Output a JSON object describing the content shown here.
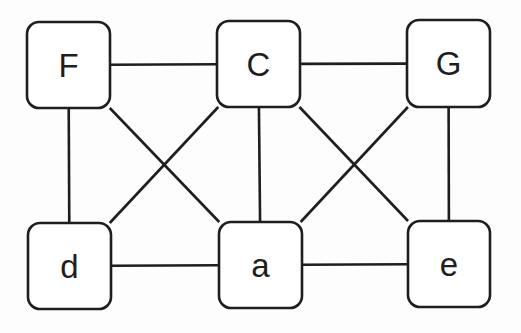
{
  "diagram": {
    "type": "graph",
    "colors": {
      "background": "#fdfdfd",
      "stroke": "#1e1e1e",
      "node_fill": "#ffffff"
    },
    "nodes": [
      {
        "id": "F",
        "label": "F",
        "x": 27,
        "y": 22,
        "w": 83,
        "h": 86
      },
      {
        "id": "C",
        "label": "C",
        "x": 217,
        "y": 21,
        "w": 83,
        "h": 86
      },
      {
        "id": "G",
        "label": "G",
        "x": 407,
        "y": 20,
        "w": 83,
        "h": 87
      },
      {
        "id": "d",
        "label": "d",
        "x": 28,
        "y": 223,
        "w": 83,
        "h": 86
      },
      {
        "id": "a",
        "label": "a",
        "x": 219,
        "y": 222,
        "w": 83,
        "h": 86
      },
      {
        "id": "e",
        "label": "e",
        "x": 408,
        "y": 221,
        "w": 82,
        "h": 86
      }
    ],
    "edges": [
      {
        "from": "F",
        "to": "C"
      },
      {
        "from": "C",
        "to": "G"
      },
      {
        "from": "F",
        "to": "d"
      },
      {
        "from": "F",
        "to": "a"
      },
      {
        "from": "C",
        "to": "d"
      },
      {
        "from": "C",
        "to": "a"
      },
      {
        "from": "C",
        "to": "e"
      },
      {
        "from": "G",
        "to": "a"
      },
      {
        "from": "G",
        "to": "e"
      },
      {
        "from": "d",
        "to": "a"
      },
      {
        "from": "a",
        "to": "e"
      }
    ]
  }
}
